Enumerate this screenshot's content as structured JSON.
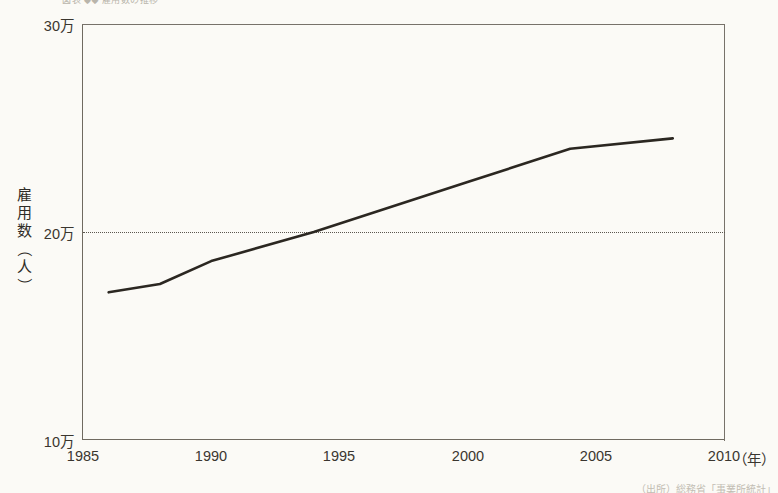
{
  "figure": {
    "top_caption": "図表 ◆◆ 雇用数の推移",
    "source_note": "（出所）総務省「事業所統計」"
  },
  "chart_data": {
    "type": "line",
    "title": "",
    "xlabel": "年",
    "ylabel": "雇用数（人）",
    "xlim": [
      1985,
      2010
    ],
    "ylim": [
      100000,
      300000
    ],
    "xticks": [
      "1985",
      "1990",
      "1995",
      "2000",
      "2005",
      "2010"
    ],
    "xtick_values": [
      1985,
      1990,
      1995,
      2000,
      2005,
      2010
    ],
    "yticks": [
      "10万",
      "20万",
      "30万"
    ],
    "ytick_values": [
      100000,
      200000,
      300000
    ],
    "grid": false,
    "legend": null,
    "reference_lines": [
      {
        "axis": "y",
        "value": 200000,
        "label": "20万",
        "style": "dotted"
      }
    ],
    "series": [
      {
        "name": "雇用数",
        "color": "#2b2721",
        "x": [
          1986,
          1988,
          1990,
          1994,
          2000,
          2004,
          2008
        ],
        "y": [
          171000,
          175000,
          186000,
          200000,
          224000,
          240000,
          245000
        ]
      }
    ]
  }
}
